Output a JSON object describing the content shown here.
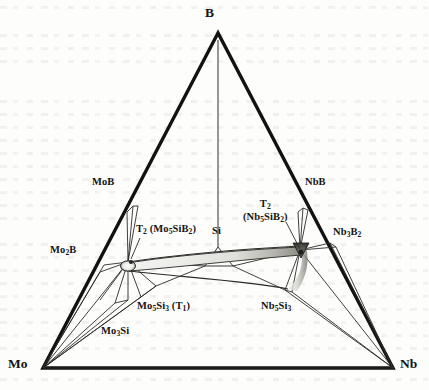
{
  "figure": {
    "type": "ternary-phase-diagram",
    "system": "Mo-Nb-Si-B",
    "background_color": "#fdfdfc",
    "line_color": "#1e1e1e",
    "outline_color": "#111111",
    "shade_color": "#8e8e88"
  },
  "vertices": {
    "top": {
      "label": "B",
      "x": 218,
      "y": 33
    },
    "bottom_left": {
      "label": "Mo",
      "x": 43,
      "y": 368
    },
    "bottom_right": {
      "label": "Nb",
      "x": 393,
      "y": 368
    }
  },
  "phases": [
    {
      "id": "mob",
      "label_html": "MoB",
      "x": 92,
      "y": 183,
      "anchor": "left"
    },
    {
      "id": "nbb",
      "label_html": "NbB",
      "x": 305,
      "y": 183,
      "anchor": "left"
    },
    {
      "id": "mo2b",
      "label_html": "Mo2B",
      "x": 50,
      "y": 249,
      "anchor": "left"
    },
    {
      "id": "nb3b2",
      "label_html": "Nb3B2",
      "x": 333,
      "y": 230,
      "anchor": "left"
    },
    {
      "id": "t2_mo",
      "label_html": "T2 (Mo5SiB2)",
      "x": 136,
      "y": 228,
      "anchor": "left"
    },
    {
      "id": "t2_nb",
      "label_html": "T2 (Nb5SiB2)",
      "x": 243,
      "y": 204,
      "anchor": "left"
    },
    {
      "id": "si",
      "label_html": "Si",
      "x": 213,
      "y": 228,
      "anchor": "left"
    },
    {
      "id": "mo5si3",
      "label_html": "Mo5Si3 (T1)",
      "x": 140,
      "y": 305,
      "anchor": "left"
    },
    {
      "id": "mo3si",
      "label_html": "Mo3Si",
      "x": 103,
      "y": 329,
      "anchor": "left"
    },
    {
      "id": "nb5si3",
      "label_html": "Nb5Si3",
      "x": 262,
      "y": 305,
      "anchor": "left"
    }
  ],
  "labels": {
    "B": "B",
    "Mo": "Mo",
    "Nb": "Nb",
    "MoB": "MoB",
    "NbB": "NbB",
    "Mo2B_main": "Mo",
    "Mo2B_sub": "2",
    "Mo2B_tail": "B",
    "Nb3B2_main": "Nb",
    "Nb3B2_sub1": "3",
    "Nb3B2_mid": "B",
    "Nb3B2_sub2": "2",
    "T2_prefix": "T",
    "T2_sub": "2",
    "T2_mo_paren_open": " (Mo",
    "T2_mo_sub5": "5",
    "T2_mo_si": "SiB",
    "T2_mo_sub2": "2",
    "T2_mo_paren_close": ")",
    "T2_nb_paren_open": "(Nb",
    "T2_nb_sub5": "5",
    "T2_nb_si": "SiB",
    "T2_nb_sub2": "2",
    "T2_nb_paren_close": ")",
    "Si": "Si",
    "Mo5Si3_a": "Mo",
    "Mo5Si3_s5": "5",
    "Mo5Si3_si": "Si",
    "Mo5Si3_s3": "3",
    "Mo5Si3_t1": " (T",
    "Mo5Si3_t1sub": "1",
    "Mo5Si3_t1close": ")",
    "Mo3Si_a": "Mo",
    "Mo3Si_s3": "3",
    "Mo3Si_si": "Si",
    "Nb5Si3_a": "Nb",
    "Nb5Si3_s5": "5",
    "Nb5Si3_si": "Si",
    "Nb5Si3_s3": "3"
  },
  "nodes": {
    "t2_mo_point": {
      "x": 128,
      "y": 262,
      "name": "T2 Mo5SiB2 composition node"
    },
    "t2_nb_point": {
      "x": 300,
      "y": 250,
      "name": "T2 Nb5SiB2 composition node"
    },
    "si_point": {
      "x": 218,
      "y": 247,
      "name": "Si apex node on B axis"
    },
    "mob_edge": {
      "x": 133,
      "y": 212,
      "name": "MoB on Mo-B edge"
    },
    "mo2b_edge": {
      "x": 103,
      "y": 268,
      "name": "Mo2B on Mo-B edge"
    },
    "nbb_edge": {
      "x": 305,
      "y": 212,
      "name": "NbB on Nb-B edge"
    },
    "nb3b2_edge": {
      "x": 330,
      "y": 243,
      "name": "Nb3B2 on Nb-B edge"
    },
    "mo5si3_edge": {
      "x": 156,
      "y": 286,
      "name": "Mo5Si3 node"
    },
    "mo3si_edge": {
      "x": 128,
      "y": 300,
      "name": "Mo3Si node"
    },
    "nb5si3_edge": {
      "x": 285,
      "y": 290,
      "name": "Nb5Si3 node"
    }
  },
  "solid_solution_band": {
    "name": "T2 continuous solid solution between Mo5SiB2 and Nb5SiB2",
    "from": "T2 (Mo5SiB2)",
    "to": "T2 (Nb5SiB2)",
    "fill": "light-gray-gradient"
  }
}
